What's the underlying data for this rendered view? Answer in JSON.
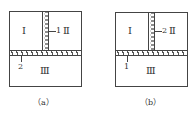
{
  "panels": [
    {
      "caption": "（a）",
      "regions": {
        "top_left": "Ⅰ",
        "top_right": "Ⅱ",
        "bottom": "Ⅲ"
      },
      "vertical_strip_label": "1",
      "horizontal_strip_label": "2"
    },
    {
      "caption": "（b）",
      "regions": {
        "top_left": "Ⅰ",
        "top_right": "Ⅱ",
        "bottom": "Ⅲ"
      },
      "vertical_strip_label": "2",
      "horizontal_strip_label": "1"
    }
  ]
}
